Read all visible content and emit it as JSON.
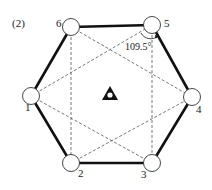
{
  "figure": {
    "panel_label": "(2)",
    "angle_label": "109.5°",
    "colors": {
      "stroke": "#111111",
      "dashed": "#555555",
      "node_fill": "#ffffff",
      "background": "#ffffff"
    },
    "nodes": [
      {
        "id": "1",
        "label": "1",
        "x": 31,
        "y": 96,
        "lx": 25,
        "ly": 111
      },
      {
        "id": "2",
        "label": "2",
        "x": 71,
        "y": 163,
        "lx": 78,
        "ly": 177
      },
      {
        "id": "3",
        "label": "3",
        "x": 152,
        "y": 163,
        "lx": 141,
        "ly": 178
      },
      {
        "id": "4",
        "label": "4",
        "x": 192,
        "y": 97,
        "lx": 196,
        "ly": 113
      },
      {
        "id": "5",
        "label": "5",
        "x": 152,
        "y": 25,
        "lx": 164,
        "ly": 27
      },
      {
        "id": "6",
        "label": "6",
        "x": 71,
        "y": 27,
        "lx": 56,
        "ly": 27
      }
    ],
    "thick_edges": [
      [
        "6",
        "5"
      ],
      [
        "5",
        "4"
      ],
      [
        "4",
        "3"
      ],
      [
        "3",
        "2"
      ],
      [
        "2",
        "1"
      ],
      [
        "1",
        "6"
      ]
    ],
    "dashed_edges": [
      [
        "6",
        "2"
      ],
      [
        "5",
        "3"
      ],
      [
        "6",
        "4"
      ],
      [
        "1",
        "5"
      ],
      [
        "1",
        "3"
      ],
      [
        "2",
        "4"
      ]
    ],
    "center_symbol": {
      "name": "triangle-with-dot",
      "x": 110,
      "y": 95
    }
  }
}
